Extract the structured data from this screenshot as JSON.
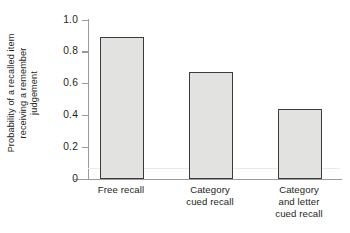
{
  "chart_data": {
    "type": "bar",
    "title": "",
    "subtitle": "",
    "xlabel": "",
    "ylabel": "Probability of a recalled item receiving a remember judgement",
    "ylabel_lines": [
      "Probability of a recalled item",
      "receiving a remember",
      "judgement"
    ],
    "categories": [
      "Free recall",
      "Category cued recall",
      "Category and letter cued recall"
    ],
    "category_label_lines": [
      [
        "Free recall"
      ],
      [
        "Category",
        "cued recall"
      ],
      [
        "Category",
        "and letter",
        "cued recall"
      ]
    ],
    "values": [
      0.89,
      0.67,
      0.44
    ],
    "ylim": [
      0,
      1.0
    ],
    "ytick_labels": [
      "1.0",
      "0.8",
      "0.6",
      "0.4",
      "0.2",
      "0"
    ],
    "ytick_values": [
      1.0,
      0.8,
      0.6,
      0.4,
      0.2,
      0
    ],
    "grid": false,
    "legend": null,
    "legend_position": "none",
    "colors": {
      "bar_fill": "#e2e2e1",
      "bar_edge": "#3b3b3b",
      "axis": "#9b9b9b",
      "text": "#231f20",
      "background": "#ffffff"
    }
  }
}
